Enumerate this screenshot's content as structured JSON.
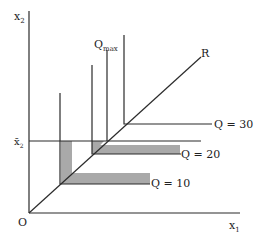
{
  "diagram": {
    "type": "isoquant-leontief",
    "axes": {
      "x_label": "x",
      "x_sub": "1",
      "y_label": "x",
      "y_sub": "2",
      "origin_label": "O"
    },
    "fixed_input_label": "x̄",
    "fixed_input_sub": "2",
    "ray_label": "R",
    "qmax_label": "Q",
    "qmax_sub": "max",
    "isoquants": [
      {
        "label": "Q = 10",
        "corner": [
          61,
          184
        ]
      },
      {
        "label": "Q = 20",
        "corner": [
          93,
          154
        ]
      },
      {
        "label": "Q = 30",
        "corner": [
          125,
          124
        ]
      }
    ],
    "colors": {
      "line": "#2b2b2b",
      "shade": "#a9a9a9"
    }
  }
}
